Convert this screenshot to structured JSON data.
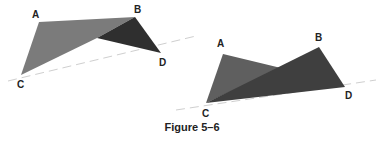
{
  "figure": {
    "caption": "Figure 5–6",
    "colors": {
      "left_light": "#7b7b7b",
      "left_dark": "#2f2f2f",
      "right_acd": "#5f5f5f",
      "right_bcd": "#3f3f3f",
      "dashed_line": "#c8c8c8",
      "label": "#222222"
    },
    "left_diagram": {
      "labels": {
        "A": "A",
        "B": "B",
        "C": "C",
        "D": "D"
      },
      "vertices": {
        "A": [
          39,
          22
        ],
        "B": [
          135,
          17
        ],
        "C": [
          21,
          75
        ],
        "D": [
          161,
          53
        ]
      }
    },
    "right_diagram": {
      "labels": {
        "A": "A",
        "B": "B",
        "C": "C",
        "D": "D"
      },
      "vertices": {
        "A": [
          223,
          54
        ],
        "B": [
          319,
          47
        ],
        "C": [
          206,
          103
        ],
        "D": [
          345,
          87
        ]
      }
    }
  }
}
